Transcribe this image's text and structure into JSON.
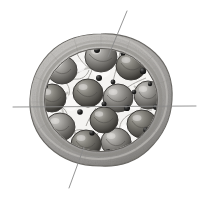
{
  "figure": {
    "title": "Cross-section of a multi-loculed fruit / ovary",
    "style": "grayscale pencil-and-wash scientific illustration",
    "background_color": "#ffffff",
    "canvas": {
      "width": 201,
      "height": 200
    }
  },
  "specimen": {
    "outline": {
      "name": "pericarp-outer-boundary",
      "center_x": 101,
      "center_y": 100,
      "radius_x": 71,
      "radius_y": 65,
      "stroke_color": "#6f6f6f",
      "fill_color": "#b9b7b4"
    },
    "rind": {
      "name": "pericarp-rind-band",
      "outer_radius_x": 71,
      "outer_radius_y": 65,
      "inner_radius_x": 57,
      "inner_radius_y": 52,
      "fill_color": "#b5b3b0",
      "shadow_color": "#8d8b88",
      "highlight_color": "#d8d6d3"
    },
    "inner_cavity": {
      "name": "locule-cavity",
      "radius_x": 57,
      "radius_y": 52,
      "fill_color": "#f2f1ef"
    },
    "locule_count": 12,
    "seed_count": 12,
    "dark_granule_count": 22
  },
  "locules": [
    {
      "name": "locule-1",
      "cx": 101,
      "cy": 57,
      "rx": 16,
      "ry": 15,
      "tone": "#8f8d8a"
    },
    {
      "name": "locule-2",
      "cx": 131,
      "cy": 66,
      "rx": 15,
      "ry": 14,
      "tone": "#7e7c79"
    },
    {
      "name": "locule-3",
      "cx": 148,
      "cy": 95,
      "rx": 14,
      "ry": 14,
      "tone": "#86847f"
    },
    {
      "name": "locule-4",
      "cx": 142,
      "cy": 124,
      "rx": 15,
      "ry": 14,
      "tone": "#7a7875"
    },
    {
      "name": "locule-5",
      "cx": 116,
      "cy": 142,
      "rx": 15,
      "ry": 14,
      "tone": "#84827e"
    },
    {
      "name": "locule-6",
      "cx": 86,
      "cy": 144,
      "rx": 15,
      "ry": 14,
      "tone": "#77756f"
    },
    {
      "name": "locule-7",
      "cx": 60,
      "cy": 127,
      "rx": 15,
      "ry": 14,
      "tone": "#8b8985"
    },
    {
      "name": "locule-8",
      "cx": 52,
      "cy": 98,
      "rx": 14,
      "ry": 14,
      "tone": "#807e7a"
    },
    {
      "name": "locule-9",
      "cx": 62,
      "cy": 70,
      "rx": 15,
      "ry": 14,
      "tone": "#8a8884"
    },
    {
      "name": "locule-10",
      "cx": 88,
      "cy": 93,
      "rx": 15,
      "ry": 14,
      "tone": "#6f6d69"
    },
    {
      "name": "locule-11",
      "cx": 118,
      "cy": 98,
      "rx": 15,
      "ry": 14,
      "tone": "#7c7a76"
    },
    {
      "name": "locule-12",
      "cx": 104,
      "cy": 120,
      "rx": 14,
      "ry": 13,
      "tone": "#757370"
    }
  ],
  "granules": [
    {
      "cx": 97,
      "cy": 50,
      "r": 3.0
    },
    {
      "cx": 123,
      "cy": 53,
      "r": 2.6
    },
    {
      "cx": 143,
      "cy": 71,
      "r": 3.2
    },
    {
      "cx": 150,
      "cy": 84,
      "r": 2.2
    },
    {
      "cx": 156,
      "cy": 107,
      "r": 3.0
    },
    {
      "cx": 146,
      "cy": 130,
      "r": 2.8
    },
    {
      "cx": 131,
      "cy": 145,
      "r": 2.4
    },
    {
      "cx": 108,
      "cy": 152,
      "r": 2.9
    },
    {
      "cx": 86,
      "cy": 155,
      "r": 2.5
    },
    {
      "cx": 66,
      "cy": 146,
      "r": 3.1
    },
    {
      "cx": 51,
      "cy": 130,
      "r": 2.7
    },
    {
      "cx": 43,
      "cy": 109,
      "r": 2.6
    },
    {
      "cx": 45,
      "cy": 86,
      "r": 2.9
    },
    {
      "cx": 56,
      "cy": 64,
      "r": 2.4
    },
    {
      "cx": 73,
      "cy": 52,
      "r": 2.8
    },
    {
      "cx": 99,
      "cy": 78,
      "r": 3.0
    },
    {
      "cx": 113,
      "cy": 82,
      "r": 2.4
    },
    {
      "cx": 127,
      "cy": 108,
      "r": 3.1
    },
    {
      "cx": 104,
      "cy": 104,
      "r": 2.5
    },
    {
      "cx": 80,
      "cy": 112,
      "r": 2.8
    },
    {
      "cx": 92,
      "cy": 133,
      "r": 2.6
    },
    {
      "cx": 134,
      "cy": 92,
      "r": 2.3
    }
  ],
  "leader_lines": [
    {
      "name": "leader-line-top",
      "orientation": "diagonal",
      "x1": 127,
      "y1": 11,
      "x2": 108,
      "y2": 57,
      "color": "#8a8a8a",
      "width": 0.9
    },
    {
      "name": "leader-line-horizontal",
      "orientation": "horizontal",
      "x1": 13,
      "y1": 107,
      "x2": 196,
      "y2": 106,
      "color": "#8a8a8a",
      "width": 0.9
    },
    {
      "name": "leader-line-bottom",
      "orientation": "diagonal",
      "x1": 84,
      "y1": 147,
      "x2": 69,
      "y2": 188,
      "color": "#8a8a8a",
      "width": 0.9
    }
  ],
  "labels": {
    "top_leader": "",
    "horizontal_leader": "",
    "bottom_leader": ""
  },
  "palette": {
    "paper": "#ffffff",
    "rind_mid": "#b5b3b0",
    "rind_dark": "#8d8b88",
    "rind_light": "#d8d6d3",
    "cavity": "#f2f1ef",
    "seed_dark": "#6f6d69",
    "granule": "#1a1a1a",
    "leader": "#8a8a8a",
    "outline": "#6f6f6f"
  }
}
